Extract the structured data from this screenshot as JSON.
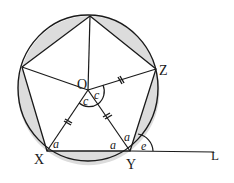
{
  "diagram": {
    "points": {
      "O": {
        "label": "O",
        "x": 88,
        "y": 90
      },
      "X": {
        "label": "X",
        "x": 47,
        "y": 151
      },
      "Y": {
        "label": "Y",
        "x": 130,
        "y": 151
      },
      "Z": {
        "label": "Z",
        "x": 156,
        "y": 69
      },
      "L": {
        "label": "L",
        "x": 214,
        "y": 152
      }
    },
    "angle_labels": {
      "a_at_X": "a",
      "a_at_Y_left": "a",
      "a_at_Y_upper": "a",
      "c_left": "c",
      "c_right": "c",
      "e": "e"
    },
    "colors": {
      "stroke": "#1a1a1a",
      "segment_fill": "#dcdcdc",
      "background": "#ffffff"
    }
  }
}
